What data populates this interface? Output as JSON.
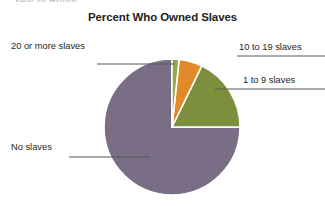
{
  "page": {
    "clipped_header_text": "Year of Honor",
    "background_color": "#ffffff",
    "text_color": "#231f20"
  },
  "chart_data": {
    "type": "pie",
    "title": "Percent Who Owned Slaves",
    "xlabel": "",
    "ylabel": "",
    "legend_position": "callout-labels",
    "grid": false,
    "categories": [
      "No slaves",
      "1 to 9 slaves",
      "10 to 19 slaves",
      "20 or more slaves"
    ],
    "values": [
      75,
      18,
      5,
      2
    ],
    "slices": [
      {
        "label": "No slaves",
        "value": 75,
        "color": "#7a6e86",
        "start_angle": 90,
        "end_angle": 360,
        "label_position": "left-bottom"
      },
      {
        "label": "1 to 9 slaves",
        "value": 18,
        "color": "#7d8f3c",
        "start_angle": 26,
        "end_angle": 90,
        "label_position": "right-middle"
      },
      {
        "label": "10 to 19 slaves",
        "value": 5,
        "color": "#e08a28",
        "start_angle": 6,
        "end_angle": 26,
        "label_position": "right-top"
      },
      {
        "label": "20 or more slaves",
        "value": 2,
        "color": "#95a84a",
        "start_angle": 0,
        "end_angle": 6,
        "label_position": "left-top"
      }
    ],
    "slice_border_color": "#ffffff",
    "center_x": 172,
    "center_y": 127,
    "radius": 68
  },
  "labels": {
    "twenty_or_more": "20 or more slaves",
    "no_slaves": "No slaves",
    "ten_to_nineteen": "10 to 19 slaves",
    "one_to_nine": "1 to 9 slaves"
  },
  "leader_line_color": "#58585b"
}
